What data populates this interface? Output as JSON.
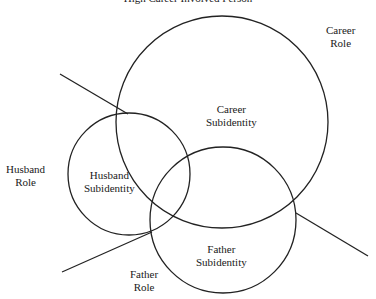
{
  "title": "High Career Involved Person",
  "labels": {
    "career_role": [
      "Career",
      "Role"
    ],
    "career_subidentity": [
      "Career",
      "Subidentity"
    ],
    "husband_role": [
      "Husband",
      "Role"
    ],
    "husband_subidentity": [
      "Husband",
      "Subidentity"
    ],
    "father_subidentity": [
      "Father",
      "Subidentity"
    ],
    "father_role": [
      "Father",
      "Role"
    ]
  },
  "shapes": {
    "stroke_color": "#222222",
    "circles": [
      {
        "name": "career-circle",
        "cx": 222,
        "cy": 122,
        "r": 106
      },
      {
        "name": "husband-circle",
        "cx": 129,
        "cy": 174,
        "r": 61
      },
      {
        "name": "father-circle",
        "cx": 223,
        "cy": 220,
        "r": 73
      }
    ],
    "lines": [
      {
        "name": "husband-role-line",
        "x1": 60,
        "y1": 74,
        "x2": 128,
        "y2": 114
      },
      {
        "name": "career-role-line",
        "x1": 296,
        "y1": 213,
        "x2": 368,
        "y2": 256
      },
      {
        "name": "father-role-line",
        "x1": 62,
        "y1": 272,
        "x2": 152,
        "y2": 232
      }
    ]
  }
}
